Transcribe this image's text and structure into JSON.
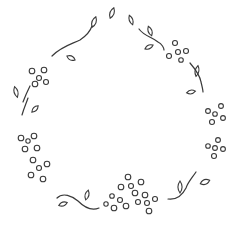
{
  "illustration": {
    "description": "Line-art wreath of leaves, vines and berry clusters",
    "background": "#ffffff",
    "stroke_color": "#3a3a3a",
    "vines": [
      "M52 56 C62 46 72 44 80 40 C86 36 90 32 92 26",
      "M23 102 C26 94 28 90 30 86",
      "M22 115 C24 108 26 104 28 98",
      "M139 29 C144 36 152 37 158 42 C162 44 164 48 164 50",
      "M190 63 C196 70 200 76 201 82 C202 86 203 90 203 92",
      "M57 198 C63 192 72 196 78 201 C84 207 92 211 99 208",
      "M168 199 C176 200 182 196 186 188 C188 182 192 178 196 172"
    ],
    "leaves": [
      {
        "cx": 94,
        "cy": 22,
        "rx": 2.6,
        "ry": 5.5,
        "rot": 20
      },
      {
        "cx": 112,
        "cy": 13,
        "rx": 2.6,
        "ry": 5.5,
        "rot": 20
      },
      {
        "cx": 71,
        "cy": 58,
        "rx": 4.5,
        "ry": 2.6,
        "rot": 25
      },
      {
        "cx": 16,
        "cy": 92,
        "rx": 2.4,
        "ry": 5.5,
        "rot": -15
      },
      {
        "cx": 35,
        "cy": 109,
        "rx": 4.5,
        "ry": 2.4,
        "rot": -45
      },
      {
        "cx": 131,
        "cy": 20,
        "rx": 2.2,
        "ry": 5,
        "rot": -20
      },
      {
        "cx": 150,
        "cy": 31,
        "rx": 2.4,
        "ry": 5,
        "rot": -20
      },
      {
        "cx": 149,
        "cy": 47,
        "rx": 4.5,
        "ry": 2.4,
        "rot": -25
      },
      {
        "cx": 197,
        "cy": 71,
        "rx": 2.4,
        "ry": 5.5,
        "rot": 10
      },
      {
        "cx": 191,
        "cy": 92,
        "rx": 4.5,
        "ry": 2.4,
        "rot": -10
      },
      {
        "cx": 63,
        "cy": 204,
        "rx": 4.5,
        "ry": 2.4,
        "rot": -20
      },
      {
        "cx": 87,
        "cy": 195,
        "rx": 2.4,
        "ry": 5,
        "rot": 15
      },
      {
        "cx": 180,
        "cy": 187,
        "rx": 2.6,
        "ry": 6,
        "rot": 0
      },
      {
        "cx": 205,
        "cy": 182,
        "rx": 5,
        "ry": 3,
        "rot": -20
      }
    ],
    "berries": [
      {
        "cx": 32,
        "cy": 71,
        "r": 2.8
      },
      {
        "cx": 44,
        "cy": 70,
        "r": 2.8
      },
      {
        "cx": 39,
        "cy": 78,
        "r": 2.5
      },
      {
        "cx": 35,
        "cy": 84,
        "r": 2.8
      },
      {
        "cx": 46,
        "cy": 82,
        "r": 2.5
      },
      {
        "cx": 175,
        "cy": 43,
        "r": 2.5
      },
      {
        "cx": 186,
        "cy": 51,
        "r": 2.5
      },
      {
        "cx": 178,
        "cy": 52,
        "r": 2.5
      },
      {
        "cx": 169,
        "cy": 56,
        "r": 2.5
      },
      {
        "cx": 181,
        "cy": 60,
        "r": 2.3
      },
      {
        "cx": 221,
        "cy": 106,
        "r": 2.4
      },
      {
        "cx": 208,
        "cy": 111,
        "r": 2.4
      },
      {
        "cx": 215,
        "cy": 114,
        "r": 2.3
      },
      {
        "cx": 223,
        "cy": 118,
        "r": 2.4
      },
      {
        "cx": 212,
        "cy": 122,
        "r": 2.5
      },
      {
        "cx": 218,
        "cy": 140,
        "r": 2.4
      },
      {
        "cx": 208,
        "cy": 146,
        "r": 2.3
      },
      {
        "cx": 215,
        "cy": 148,
        "r": 2.4
      },
      {
        "cx": 223,
        "cy": 149,
        "r": 2.4
      },
      {
        "cx": 214,
        "cy": 156,
        "r": 2.5
      },
      {
        "cx": 21,
        "cy": 138,
        "r": 2.8
      },
      {
        "cx": 28,
        "cy": 141,
        "r": 2.2
      },
      {
        "cx": 34,
        "cy": 136,
        "r": 2.8
      },
      {
        "cx": 25,
        "cy": 149,
        "r": 2.8
      },
      {
        "cx": 37,
        "cy": 148,
        "r": 2.8
      },
      {
        "cx": 33,
        "cy": 160,
        "r": 2.8
      },
      {
        "cx": 39,
        "cy": 168,
        "r": 2.5
      },
      {
        "cx": 47,
        "cy": 164,
        "r": 2.8
      },
      {
        "cx": 31,
        "cy": 175,
        "r": 2.8
      },
      {
        "cx": 43,
        "cy": 179,
        "r": 2.8
      },
      {
        "cx": 128,
        "cy": 177,
        "r": 2.8
      },
      {
        "cx": 131,
        "cy": 186,
        "r": 2.5
      },
      {
        "cx": 141,
        "cy": 182,
        "r": 2.8
      },
      {
        "cx": 121,
        "cy": 187,
        "r": 2.8
      },
      {
        "cx": 135,
        "cy": 193,
        "r": 2.8
      },
      {
        "cx": 145,
        "cy": 195,
        "r": 2.8
      },
      {
        "cx": 112,
        "cy": 196,
        "r": 2.3
      },
      {
        "cx": 120,
        "cy": 200,
        "r": 2.5
      },
      {
        "cx": 114,
        "cy": 208,
        "r": 2.8
      },
      {
        "cx": 126,
        "cy": 206,
        "r": 2.8
      },
      {
        "cx": 138,
        "cy": 202,
        "r": 2.5
      },
      {
        "cx": 147,
        "cy": 203,
        "r": 2.5
      },
      {
        "cx": 155,
        "cy": 199,
        "r": 2.5
      },
      {
        "cx": 149,
        "cy": 211,
        "r": 2.8
      },
      {
        "cx": 106,
        "cy": 204,
        "r": 2.2
      }
    ]
  }
}
